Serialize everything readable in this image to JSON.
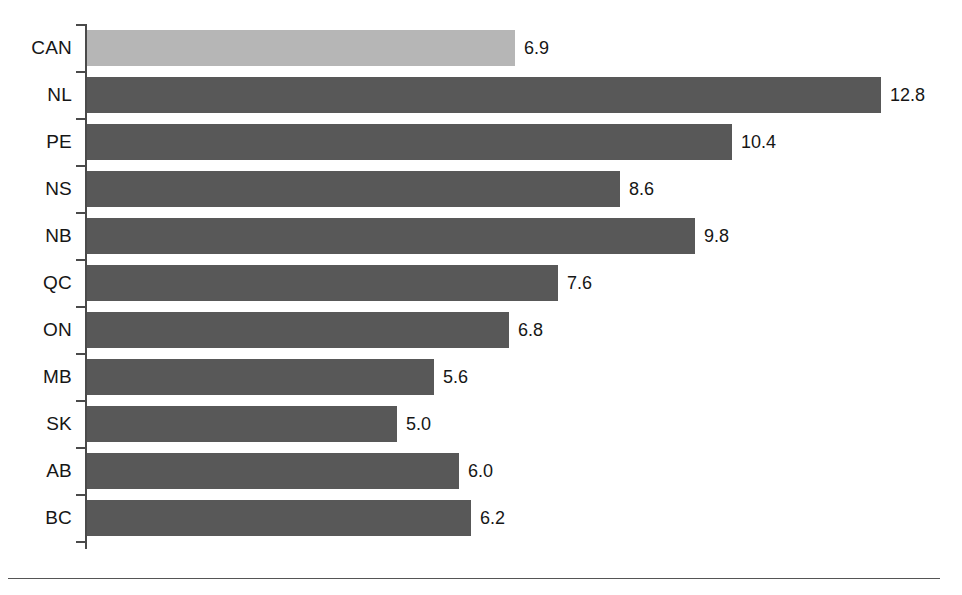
{
  "chart_data": {
    "type": "bar",
    "orientation": "horizontal",
    "title": "",
    "subtitle": "",
    "xlabel": "",
    "ylabel": "",
    "categories": [
      "CAN",
      "NL",
      "PE",
      "NS",
      "NB",
      "QC",
      "ON",
      "MB",
      "SK",
      "AB",
      "BC"
    ],
    "values": [
      6.9,
      12.8,
      10.4,
      8.6,
      9.8,
      7.6,
      6.8,
      5.6,
      5.0,
      6.0,
      6.2
    ],
    "value_labels": [
      "6.9",
      "12.8",
      "10.4",
      "8.6",
      "9.8",
      "7.6",
      "6.8",
      "5.6",
      "5.0",
      "6.0",
      "6.2"
    ],
    "xlim": [
      0,
      14
    ],
    "grid": false,
    "legend": "none",
    "bars": [
      {
        "category": "CAN",
        "value": 6.9,
        "label": "6.9",
        "color": "#b6b6b6",
        "highlight": true
      },
      {
        "category": "NL",
        "value": 12.8,
        "label": "12.8",
        "color": "#585858",
        "highlight": false
      },
      {
        "category": "PE",
        "value": 10.4,
        "label": "10.4",
        "color": "#585858",
        "highlight": false
      },
      {
        "category": "NS",
        "value": 8.6,
        "label": "8.6",
        "color": "#585858",
        "highlight": false
      },
      {
        "category": "NB",
        "value": 9.8,
        "label": "9.8",
        "color": "#585858",
        "highlight": false
      },
      {
        "category": "QC",
        "value": 7.6,
        "label": "7.6",
        "color": "#585858",
        "highlight": false
      },
      {
        "category": "ON",
        "value": 6.8,
        "label": "6.8",
        "color": "#585858",
        "highlight": false
      },
      {
        "category": "MB",
        "value": 5.6,
        "label": "5.6",
        "color": "#585858",
        "highlight": false
      },
      {
        "category": "SK",
        "value": 5.0,
        "label": "5.0",
        "color": "#585858",
        "highlight": false
      },
      {
        "category": "AB",
        "value": 6.0,
        "label": "6.0",
        "color": "#585858",
        "highlight": false
      },
      {
        "category": "BC",
        "value": 6.2,
        "label": "6.2",
        "color": "#585858",
        "highlight": false
      }
    ],
    "colors": {
      "bar_default": "#585858",
      "bar_highlight": "#b6b6b6",
      "axis": "#4a4a4a",
      "text": "#161616",
      "rule": "#555555",
      "background": "#ffffff"
    },
    "geometry": {
      "axis_x": 85,
      "axis_top": 24,
      "axis_bottom": 549,
      "row_pitch": 47,
      "bar_height": 36,
      "px_per_unit": 62,
      "label_gap": 9
    }
  }
}
